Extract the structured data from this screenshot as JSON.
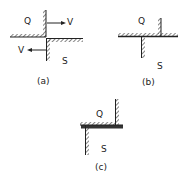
{
  "figure": {
    "panels": [
      {
        "id": "a",
        "caption": "(a)",
        "upper_label": "Q",
        "lower_label": "S",
        "velocity_label_top": "V",
        "velocity_label_bottom": "V"
      },
      {
        "id": "b",
        "caption": "(b)",
        "upper_label": "Q",
        "lower_label": "S"
      },
      {
        "id": "c",
        "caption": "(c)",
        "upper_label": "Q",
        "lower_label": "S"
      }
    ],
    "colors": {
      "line": "#222222",
      "hatch": "#444444",
      "background": "#ffffff"
    }
  }
}
